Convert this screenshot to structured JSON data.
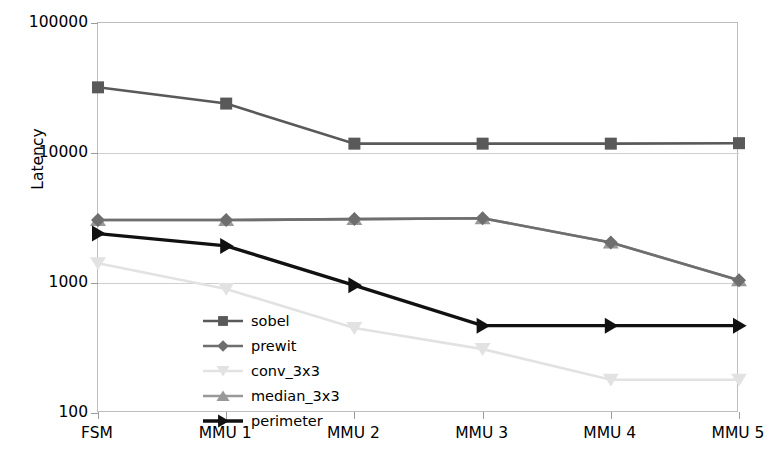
{
  "chart_data": {
    "type": "line",
    "title": "",
    "xlabel": "",
    "ylabel": "Latency",
    "log_y": true,
    "ylim": [
      100,
      100000
    ],
    "grid": true,
    "legend_position": "inside-lower-left",
    "categories": [
      "FSM",
      "MMU 1",
      "MMU 2",
      "MMU 3",
      "MMU 4",
      "MMU 5"
    ],
    "ytick_labels": [
      "100000",
      "10000",
      "1000",
      "100"
    ],
    "ytick_values": [
      100000,
      10000,
      1000,
      100
    ],
    "series": [
      {
        "name": "sobel",
        "marker": "square",
        "color": "#595959",
        "values": [
          32000,
          24000,
          11800,
          11800,
          11800,
          11900
        ]
      },
      {
        "name": "prewit",
        "marker": "diamond",
        "color": "#6e6e6e",
        "values": [
          3050,
          3050,
          3100,
          3150,
          2050,
          1050
        ]
      },
      {
        "name": "conv_3x3",
        "marker": "triangle-down",
        "color": "#e2e2e2",
        "values": [
          1420,
          900,
          450,
          310,
          180,
          180
        ]
      },
      {
        "name": "median_3x3",
        "marker": "triangle-up",
        "color": "#999999",
        "values": [
          3050,
          3050,
          3100,
          3150,
          2050,
          1050
        ]
      },
      {
        "name": "perimeter",
        "marker": "triangle-right",
        "color": "#111111",
        "values": [
          2400,
          1930,
          960,
          470,
          470,
          470
        ]
      }
    ]
  },
  "axes": {
    "y_title": "Latency",
    "y_ticks": [
      "100000",
      "10000",
      "1000",
      "100"
    ],
    "x_ticks": [
      "FSM",
      "MMU 1",
      "MMU 2",
      "MMU 3",
      "MMU 4",
      "MMU 5"
    ]
  },
  "legend": {
    "entries": [
      {
        "label": "sobel"
      },
      {
        "label": "prewit"
      },
      {
        "label": "conv_3x3"
      },
      {
        "label": "median_3x3"
      },
      {
        "label": "perimeter"
      }
    ]
  },
  "colors": {
    "grid": "#cfcfcf",
    "frame": "#bdbdbd",
    "background": "#ffffff",
    "text": "#000000"
  }
}
